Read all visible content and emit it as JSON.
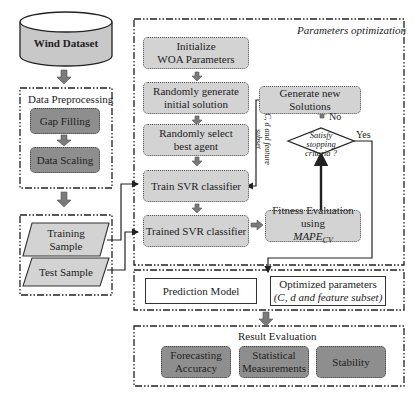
{
  "input": {
    "dataset_label": "Wind Dataset"
  },
  "preprocessing": {
    "group_label": "Data Preprocessing",
    "steps": [
      "Gap Filling",
      "Data Scaling"
    ]
  },
  "samples": {
    "training_line1": "Training",
    "training_line2": "Sample",
    "test": "Test Sample"
  },
  "optimization": {
    "group_label": "Parameters optimization",
    "steps": [
      {
        "line1": "Initialize",
        "line2": "WOA Parameters"
      },
      {
        "line1": "Randomly generate",
        "line2": "initial solution"
      },
      {
        "line1": "Randomly select",
        "line2": "best agent"
      },
      {
        "line1": "Train SVR classifier",
        "line2": ""
      },
      {
        "line1": "Trained SVR classifier",
        "line2": ""
      }
    ],
    "generate_new": "Generate new Solutions",
    "decision_line1": "Satisfy stopping",
    "decision_line2": "criteria ?",
    "no_label": "No",
    "yes_label": "Yes",
    "fitness_line1": "Fitness Evaluation using",
    "fitness_metric": "MAPE",
    "fitness_metric_sub": "CV",
    "feedback_line1": "C, d and feature",
    "feedback_line2": "subset"
  },
  "output": {
    "prediction_model": "Prediction Model",
    "optimized_line1": "Optimized parameters",
    "optimized_line2": "(C, d and feature subset)"
  },
  "evaluation": {
    "group_label": "Result Evaluation",
    "items": [
      {
        "line1": "Forecasting",
        "line2": "Accuracy"
      },
      {
        "line1": "Statistical",
        "line2": "Measurements"
      },
      {
        "line1": "Stability",
        "line2": ""
      }
    ]
  },
  "colors": {
    "light_fill": "#d3d3d3",
    "dark_fill": "#8e8e8e",
    "arrow_fill": "#7a7a7a",
    "line": "#222222"
  }
}
